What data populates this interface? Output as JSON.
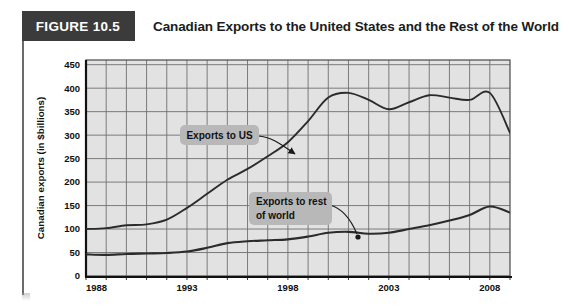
{
  "header": {
    "figure_tag": "FIGURE 10.5",
    "title": "Canadian Exports to the United States and the Rest of the World"
  },
  "colors": {
    "tag_background": "#3b3b3b",
    "tag_text": "#ffffff",
    "title_text": "#1c1c1c",
    "plot_background": "#e2e2e2",
    "gridline": "#6f6f6f",
    "axis": "#1a1a1a",
    "series_line": "#2b2b2b",
    "annotation_box": "#b8b8b8",
    "annotation_text": "#111111"
  },
  "chart_data": {
    "type": "line",
    "title": "Canadian Exports to the United States and the Rest of the World",
    "xlabel": "",
    "ylabel": "Canadian exports (in $billions)",
    "xlim": [
      1988,
      2009
    ],
    "ylim": [
      0,
      460
    ],
    "yticks": [
      0,
      50,
      100,
      150,
      200,
      250,
      300,
      350,
      400,
      450
    ],
    "ytick_labels": [
      "0",
      "50",
      "100",
      "150",
      "200",
      "250",
      "300",
      "350",
      "400",
      "450"
    ],
    "xticks": [
      1988,
      1993,
      1998,
      2003,
      2008
    ],
    "xtick_labels": [
      "1988",
      "1993",
      "1998",
      "2003",
      "2008"
    ],
    "x_minor_step": 1,
    "grid": true,
    "legend": "annotations",
    "x": [
      1988,
      1989,
      1990,
      1991,
      1992,
      1993,
      1994,
      1995,
      1996,
      1997,
      1998,
      1999,
      2000,
      2001,
      2002,
      2003,
      2004,
      2005,
      2006,
      2007,
      2008,
      2009
    ],
    "series": [
      {
        "name": "Exports to US",
        "values": [
          100,
          102,
          108,
          110,
          120,
          145,
          175,
          205,
          228,
          255,
          285,
          330,
          380,
          390,
          375,
          355,
          370,
          385,
          380,
          375,
          390,
          305
        ],
        "peak_value": 400,
        "annotation": "Exports to US"
      },
      {
        "name": "Exports to rest of world",
        "values": [
          46,
          45,
          47,
          48,
          49,
          52,
          60,
          70,
          74,
          76,
          78,
          84,
          92,
          94,
          90,
          92,
          100,
          108,
          118,
          130,
          148,
          135
        ],
        "annotation": "Exports to rest of world"
      }
    ],
    "annotations": [
      {
        "label": "Exports to US",
        "lines": [
          "Exports to US"
        ]
      },
      {
        "label": "Exports to rest of world",
        "lines": [
          "Exports to rest",
          "of world"
        ]
      }
    ]
  }
}
